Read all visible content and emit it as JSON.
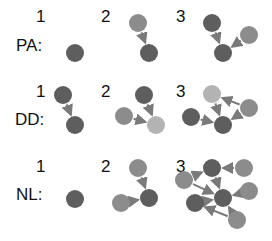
{
  "colors": {
    "dark": "#5e5e5e",
    "medium": "#8c8c8c",
    "light": "#b3b3b3",
    "arrow": "#7a7a7a"
  },
  "rows": [
    {
      "label": "PA:",
      "label_pos": [
        16,
        37
      ],
      "steps": [
        {
          "number": "1",
          "num_pos": [
            36,
            8
          ],
          "nodes": [
            {
              "x": 75,
              "y": 53,
              "shade": "dark"
            }
          ],
          "edges": []
        },
        {
          "number": "2",
          "num_pos": [
            101,
            8
          ],
          "nodes": [
            {
              "x": 138,
              "y": 23,
              "shade": "medium"
            },
            {
              "x": 149,
              "y": 53,
              "shade": "dark"
            }
          ],
          "edges": [
            [
              0,
              1
            ]
          ]
        },
        {
          "number": "3",
          "num_pos": [
            176,
            8
          ],
          "nodes": [
            {
              "x": 212,
              "y": 23,
              "shade": "dark"
            },
            {
              "x": 223,
              "y": 53,
              "shade": "dark"
            },
            {
              "x": 249,
              "y": 35,
              "shade": "medium"
            }
          ],
          "edges": [
            [
              0,
              1
            ],
            [
              2,
              1
            ]
          ]
        }
      ]
    },
    {
      "label": "DD:",
      "label_pos": [
        15,
        111
      ],
      "steps": [
        {
          "number": "1",
          "num_pos": [
            36,
            83
          ],
          "nodes": [
            {
              "x": 63,
              "y": 95,
              "shade": "dark"
            },
            {
              "x": 75,
              "y": 125,
              "shade": "dark"
            }
          ],
          "edges": [
            [
              0,
              1
            ]
          ]
        },
        {
          "number": "2",
          "num_pos": [
            101,
            83
          ],
          "nodes": [
            {
              "x": 144,
              "y": 95,
              "shade": "dark"
            },
            {
              "x": 124,
              "y": 116,
              "shade": "medium"
            },
            {
              "x": 156,
              "y": 125,
              "shade": "light"
            }
          ],
          "edges": [
            [
              0,
              2
            ],
            [
              1,
              2
            ]
          ]
        },
        {
          "number": "3",
          "num_pos": [
            176,
            83
          ],
          "nodes": [
            {
              "x": 212,
              "y": 94,
              "shade": "light"
            },
            {
              "x": 249,
              "y": 108,
              "shade": "medium"
            },
            {
              "x": 191,
              "y": 117,
              "shade": "dark"
            },
            {
              "x": 223,
              "y": 125,
              "shade": "dark"
            }
          ],
          "edges": [
            [
              1,
              0
            ],
            [
              0,
              3
            ],
            [
              1,
              3
            ],
            [
              2,
              3
            ]
          ]
        }
      ]
    },
    {
      "label": "NL:",
      "label_pos": [
        16,
        186
      ],
      "steps": [
        {
          "number": "1",
          "num_pos": [
            36,
            158
          ],
          "nodes": [
            {
              "x": 75,
              "y": 199,
              "shade": "dark"
            }
          ],
          "edges": []
        },
        {
          "number": "2",
          "num_pos": [
            101,
            158
          ],
          "nodes": [
            {
              "x": 138,
              "y": 168,
              "shade": "medium"
            },
            {
              "x": 149,
              "y": 198,
              "shade": "dark"
            },
            {
              "x": 121,
              "y": 203,
              "shade": "medium"
            }
          ],
          "edges": [
            [
              0,
              1
            ],
            [
              2,
              1
            ]
          ]
        },
        {
          "number": "3",
          "num_pos": [
            176,
            158
          ],
          "nodes": [
            {
              "x": 212,
              "y": 168,
              "shade": "dark"
            },
            {
              "x": 244,
              "y": 168,
              "shade": "medium"
            },
            {
              "x": 184,
              "y": 180,
              "shade": "medium"
            },
            {
              "x": 223,
              "y": 198,
              "shade": "dark"
            },
            {
              "x": 249,
              "y": 191,
              "shade": "medium"
            },
            {
              "x": 195,
              "y": 203,
              "shade": "dark"
            },
            {
              "x": 237,
              "y": 220,
              "shade": "medium"
            }
          ],
          "edges": [
            [
              1,
              0
            ],
            [
              2,
              0
            ],
            [
              0,
              3
            ],
            [
              2,
              3
            ],
            [
              4,
              3
            ],
            [
              5,
              3
            ],
            [
              6,
              3
            ],
            [
              6,
              5
            ]
          ]
        }
      ]
    }
  ]
}
